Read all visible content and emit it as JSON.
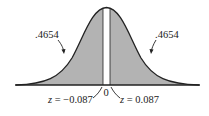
{
  "diagram": {
    "type": "normal-distribution",
    "left_area_label": ".4654",
    "right_area_label": ".4654",
    "center_label": "0",
    "left_z_var": "z",
    "left_z_value": " = −0.087",
    "right_z_var": "z",
    "right_z_value": " = 0.087",
    "colors": {
      "shade": "#b3b3b3",
      "curve": "#222222",
      "gap": "#ffffff"
    }
  }
}
